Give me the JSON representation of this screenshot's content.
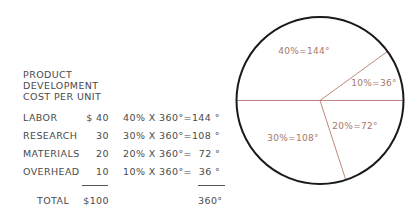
{
  "table": {
    "title_lines": [
      "PRODUCT",
      "DEVELOPMENT",
      "COST PER UNIT"
    ],
    "rows": [
      {
        "label": "LABOR",
        "amount": "$ 40",
        "formula": "40% X 360°=144 °"
      },
      {
        "label": "RESEARCH",
        "amount": "30",
        "formula": "30% X 360°=108 °"
      },
      {
        "label": "MATERIALS",
        "amount": "20",
        "formula": "20% X 360°=  72 °"
      },
      {
        "label": "OVERHEAD",
        "amount": "10",
        "formula": "10% X 360°=  36 °"
      }
    ],
    "total_label": "TOTAL",
    "total_amount": "$100",
    "total_degrees": "360°"
  },
  "colors": {
    "text": "#4a4a4a",
    "pie_outline": "#1a1a1a",
    "pie_divider": "#b57a6a",
    "pie_label": "#a8776c"
  },
  "chart_data": {
    "type": "pie",
    "slices": [
      {
        "name": "LABOR",
        "value": 40,
        "percent": 40,
        "degrees": 144,
        "label": "40%=144°",
        "start_deg": 36,
        "end_deg": 180
      },
      {
        "name": "RESEARCH",
        "value": 30,
        "percent": 30,
        "degrees": 108,
        "label": "30%=108°",
        "start_deg": 180,
        "end_deg": 288
      },
      {
        "name": "MATERIALS",
        "value": 20,
        "percent": 20,
        "degrees": 72,
        "label": "20%=72°",
        "start_deg": 288,
        "end_deg": 360
      },
      {
        "name": "OVERHEAD",
        "value": 10,
        "percent": 10,
        "degrees": 36,
        "label": "10%=36°",
        "start_deg": 0,
        "end_deg": 36
      }
    ],
    "total": 100,
    "total_degrees": 360
  }
}
